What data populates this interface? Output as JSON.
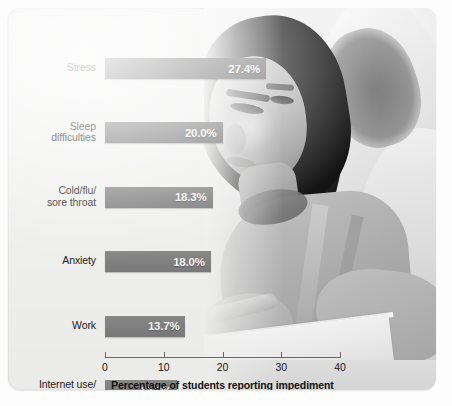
{
  "chart_data": {
    "type": "bar",
    "orientation": "horizontal",
    "title": "",
    "xlabel": "Percentage of students reporting impediment",
    "ylabel": "",
    "xlim": [
      0,
      40
    ],
    "xticks": [
      "0",
      "10",
      "20",
      "30",
      "40"
    ],
    "grid": false,
    "legend": null,
    "bar_color": "#868686",
    "value_label_color": "#ffffff",
    "categories": [
      "Stress",
      "Sleep difficulties",
      "Cold/flu/ sore throat",
      "Anxiety",
      "Work",
      "Internet use/ computer games",
      "Depression",
      "Concern for friend/ family member",
      "Relationship difficulties",
      "Extracurricular activities"
    ],
    "values": [
      27.4,
      20.0,
      18.3,
      18.0,
      13.7,
      12.3,
      11.7,
      11.1,
      11.0,
      9.1
    ],
    "value_labels": [
      "27.4%",
      "20.0%",
      "18.3%",
      "18.0%",
      "13.7%",
      "12.3%",
      "11.7%",
      "11.1%",
      "11.0%",
      "9.1%"
    ],
    "category_lines": [
      [
        "Stress"
      ],
      [
        "Sleep",
        "difficulties"
      ],
      [
        "Cold/flu/",
        "sore throat"
      ],
      [
        "Anxiety"
      ],
      [
        "Work"
      ],
      [
        "Internet use/",
        "computer games"
      ],
      [
        "Depression"
      ],
      [
        "Concern for friend/",
        "family member"
      ],
      [
        "Relationship",
        "difficulties"
      ],
      [
        "Extracurricular",
        "activities"
      ]
    ]
  },
  "photo": {
    "description": "student-reading-book-photo"
  }
}
